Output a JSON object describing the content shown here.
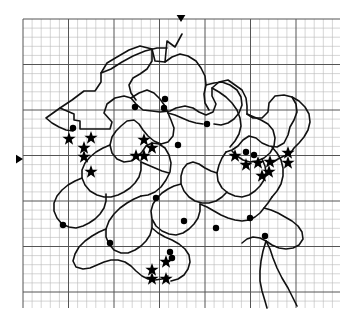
{
  "figure": {
    "background_color": "#ffffff",
    "ink_color": "#1a1a1a",
    "grid": {
      "minor_color": "#b9b9b9",
      "major_color": "#555555",
      "minor_spacing_px": 9.1,
      "major_every": 5,
      "x_start": 23,
      "x_end": 340,
      "y_start": 19,
      "y_end": 308,
      "minor_line_width": 0.6,
      "major_line_width": 1.0
    },
    "edge_markers": [
      {
        "name": "top-axis-marker",
        "shape": "triangle-down",
        "x": 181,
        "y": 15,
        "size": 7
      },
      {
        "name": "left-axis-marker",
        "shape": "triangle-right",
        "x": 16,
        "y": 159,
        "size": 7
      }
    ],
    "outline": {
      "stroke_width": 1.6,
      "stroke_color": "#111111",
      "description": "Irregular closed territory outline with many interior subdivision boundaries, plus a trailing river-like line at lower right"
    },
    "symbols": {
      "star": {
        "label": "star-site",
        "count": 21,
        "size": 7,
        "color": "#000000"
      },
      "dot": {
        "label": "dot-site",
        "count": 15,
        "size": 3.2,
        "color": "#000000"
      }
    },
    "stars": [
      {
        "x": 69,
        "y": 139
      },
      {
        "x": 91,
        "y": 138
      },
      {
        "x": 84,
        "y": 148
      },
      {
        "x": 84,
        "y": 157
      },
      {
        "x": 91,
        "y": 172
      },
      {
        "x": 144,
        "y": 140
      },
      {
        "x": 152,
        "y": 148
      },
      {
        "x": 136,
        "y": 156
      },
      {
        "x": 144,
        "y": 156
      },
      {
        "x": 235,
        "y": 156
      },
      {
        "x": 246,
        "y": 165
      },
      {
        "x": 258,
        "y": 163
      },
      {
        "x": 270,
        "y": 162
      },
      {
        "x": 269,
        "y": 172
      },
      {
        "x": 288,
        "y": 153
      },
      {
        "x": 288,
        "y": 163
      },
      {
        "x": 152,
        "y": 270
      },
      {
        "x": 166,
        "y": 262
      },
      {
        "x": 152,
        "y": 279
      },
      {
        "x": 166,
        "y": 279
      },
      {
        "x": 262,
        "y": 176
      }
    ],
    "dots": [
      {
        "x": 73,
        "y": 128
      },
      {
        "x": 135,
        "y": 107
      },
      {
        "x": 165,
        "y": 99
      },
      {
        "x": 164,
        "y": 108
      },
      {
        "x": 207,
        "y": 124
      },
      {
        "x": 178,
        "y": 145
      },
      {
        "x": 246,
        "y": 152
      },
      {
        "x": 254,
        "y": 155
      },
      {
        "x": 156,
        "y": 198
      },
      {
        "x": 250,
        "y": 218
      },
      {
        "x": 63,
        "y": 225
      },
      {
        "x": 184,
        "y": 221
      },
      {
        "x": 110,
        "y": 243
      },
      {
        "x": 216,
        "y": 228
      },
      {
        "x": 170,
        "y": 252
      },
      {
        "x": 172,
        "y": 258
      },
      {
        "x": 265,
        "y": 236
      }
    ],
    "paths": [
      "M 182 34 L 175 47 L 167 41 L 165 62 L 155 61 L 152 49 L 140 46 L 129 50 L 117 57 L 107 63 L 101 73 L 101 82 L 95 91 L 84 91 L 72 100 L 60 108 L 74 114 L 74 120 L 80 121 L 80 129 L 98 129 L 110 129 L 112 122 L 104 113 L 107 104 L 115 98 L 124 96 L 131 98 L 136 104 L 143 110 L 152 111 L 160 112 L 170 111 L 176 108 L 185 106 L 193 108 L 199 112 L 206 115 L 213 112 L 216 104 L 212 96 L 212 88 L 219 82 L 228 80 L 235 85 L 242 90 L 246 98 L 247 106 L 247 114 L 253 118 L 262 118 L 268 112 L 269 103 L 275 96 L 284 95 L 292 97 L 296 104 L 297 112 L 294 120 L 290 127 L 288 135 L 284 143 L 277 147 L 269 146 L 262 143 L 256 138 L 249 136 L 243 140 L 238 146 L 232 150 L 226 152",
      "M 101 73 L 111 69 L 122 62 L 133 56 L 145 51 L 157 48 L 167 48",
      "M 165 62 L 172 57 L 180 54 L 188 56 L 196 61 L 201 68 L 205 76 L 206 85 L 204 94 L 205 103 L 209 110",
      "M 152 49 L 152 61 L 147 69 L 140 74 L 133 78 L 129 85 L 131 93 L 136 100",
      "M 131 98 L 139 93 L 147 90 L 154 93 L 160 99 L 165 106 L 168 113 L 171 120 L 174 128 L 173 136 L 168 142 L 161 144 L 154 141 L 148 136 L 143 130 L 139 124 L 134 120 L 127 121 L 121 126 L 116 131 L 112 137 L 110 145 L 112 153 L 117 159 L 124 162 L 131 161 L 137 157 L 142 152 L 146 146 L 152 143 L 159 144 L 165 148 L 169 155 L 171 163 L 170 172 L 166 180 L 161 187 L 155 192 L 148 195 L 141 196",
      "M 206 85 L 214 83 L 222 82 L 230 85 L 237 90 L 241 97 L 242 105 L 239 113 L 234 119 L 228 123 L 221 125 L 214 124",
      "M 247 114 L 254 117 L 261 120 L 268 124 L 273 130 L 275 138 L 274 146 L 270 153 L 264 158 L 257 161 L 250 162 L 243 160 L 237 156 L 232 151",
      "M 226 152 L 222 158 L 219 165 L 217 173 L 218 181 L 222 188 L 228 193 L 235 196 L 242 197 L 249 195 L 255 191 L 260 186 L 264 180 L 266 173 L 265 166 L 262 159",
      "M 217 173 L 211 171 L 205 168 L 199 164 L 193 162 L 187 164 L 183 169 L 181 176 L 181 184 L 184 191 L 189 197 L 195 201 L 202 203 L 209 203 L 216 201 L 222 197 L 227 192",
      "M 181 184 L 174 186 L 168 189 L 162 193 L 157 198 L 153 204 L 151 211 L 152 219 L 156 226 L 162 231 L 169 234 L 176 235 L 183 233 L 189 229 L 194 224 L 198 218 L 200 211 L 200 204",
      "M 141 196 L 134 199 L 127 203 L 120 208 L 114 214 L 109 221 L 106 229 L 106 237 L 109 244 L 114 250 L 121 253 L 128 253 L 135 250 L 141 246 L 146 241 L 150 235 L 152 228 L 152 220",
      "M 106 229 L 99 232 L 92 236 L 85 241 L 79 247 L 75 254 L 73 261 L 76 267 L 83 269 L 90 268 L 97 265 L 104 262 L 111 260 L 118 260 L 125 262 L 131 266 L 136 271 L 142 276 L 148 279 L 155 280 L 162 279 L 168 276",
      "M 152 228 L 158 233 L 165 237 L 172 240 L 179 244 L 185 249 L 189 255 L 190 262 L 188 269 L 184 275 L 178 279 L 171 281",
      "M 200 204 L 207 207 L 214 211 L 221 215 L 228 218 L 235 220 L 242 221 L 249 220 L 255 217 L 260 213 L 264 208 L 268 203 L 272 197",
      "M 264 208 L 271 210 L 278 213 L 285 217 L 292 221 L 298 226 L 302 232 L 303 239 L 299 245 L 293 248 L 286 249 L 279 248 L 272 245 L 266 241 L 260 238 L 253 237 L 247 239 L 242 243",
      "M 266 241 L 270 249 L 273 258 L 277 268 L 282 278 L 288 288 L 293 298 L 297 306",
      "M 266 241 L 263 251 L 261 261 L 260 271 L 260 281 L 262 291 L 265 301 L 267 308",
      "M 272 197 L 277 191 L 281 184 L 283 176 L 283 168 L 281 160 L 277 153 L 272 147",
      "M 292 97 L 299 101 L 305 107 L 309 114 L 310 122 L 308 130 L 304 137 L 299 143 L 294 148 L 290 154",
      "M 290 154 L 284 156 L 278 159 L 272 163",
      "M 60 108 L 53 113 L 46 118 L 52 123 L 59 127 L 66 130 L 73 131",
      "M 212 88 L 219 92 L 226 97 L 232 103 L 237 110 L 240 118 L 241 126 L 239 134 L 235 141 L 230 147",
      "M 168 113 L 175 115 L 182 118 L 189 121 L 196 123 L 203 124",
      "M 110 145 L 103 148 L 96 152 L 90 157 L 85 163 L 82 170 L 82 178 L 85 185 L 90 191 L 97 195 L 104 197 L 111 197 L 118 195 L 124 192 L 130 188 L 135 183 L 139 177 L 141 170 L 141 162",
      "M 141 162 L 148 165 L 155 168 L 162 171 L 169 173",
      "M 82 178 L 75 181 L 68 185 L 62 190 L 57 196 L 54 203 L 54 211 L 57 218 L 62 224 L 69 227 L 76 228 L 83 226 L 89 223 L 95 219 L 100 214 L 104 208 L 106 201 L 106 194"
    ]
  }
}
